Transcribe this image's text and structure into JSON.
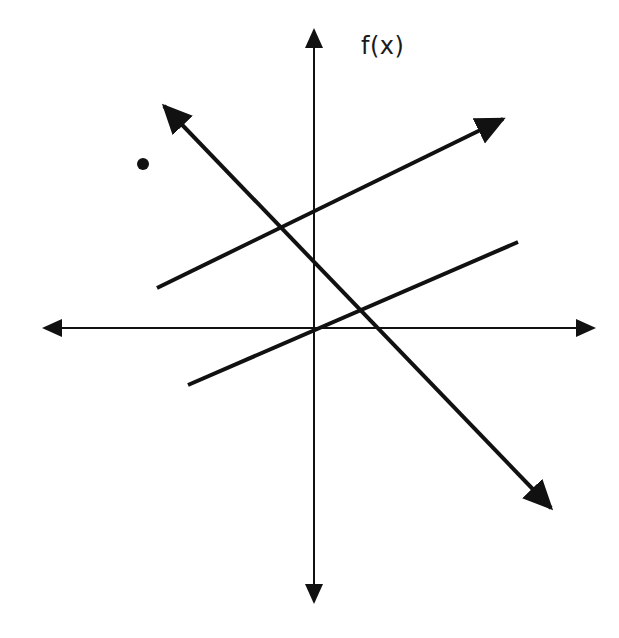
{
  "diagram": {
    "title": "",
    "axis_label_y": "f(x)",
    "canvas": {
      "width": 619,
      "height": 638
    },
    "colors": {
      "ink": "#111111",
      "background": "#ffffff"
    },
    "axes": {
      "origin": {
        "x": 314,
        "y": 328
      },
      "x_axis": {
        "x1": 44,
        "x2": 594,
        "y": 328,
        "stroke_width": 2,
        "arrowheads": [
          "left",
          "right"
        ]
      },
      "y_axis": {
        "x": 314,
        "y1": 30,
        "y2": 602,
        "stroke_width": 2,
        "arrowheads": [
          "up",
          "down"
        ]
      }
    },
    "lines": [
      {
        "name": "upper-line",
        "description": "positive slope, segment with arrowhead at upper-right end",
        "x1": 157,
        "y1": 288,
        "x2": 503,
        "y2": 119,
        "stroke_width": 4,
        "arrow_start": false,
        "arrow_end": true
      },
      {
        "name": "lower-line",
        "description": "positive slope, segment without arrowheads, passes near origin",
        "x1": 188,
        "y1": 385,
        "x2": 518,
        "y2": 242,
        "stroke_width": 4,
        "arrow_start": false,
        "arrow_end": false
      },
      {
        "name": "decreasing-line",
        "description": "negative slope, arrowheads at both ends",
        "x1": 164,
        "y1": 106,
        "x2": 551,
        "y2": 508,
        "stroke_width": 4,
        "arrow_start": true,
        "arrow_end": true
      }
    ],
    "points": [
      {
        "name": "isolated-point",
        "x": 143,
        "y": 164,
        "r": 6
      }
    ],
    "label_position": {
      "x": 361,
      "y": 34
    }
  }
}
